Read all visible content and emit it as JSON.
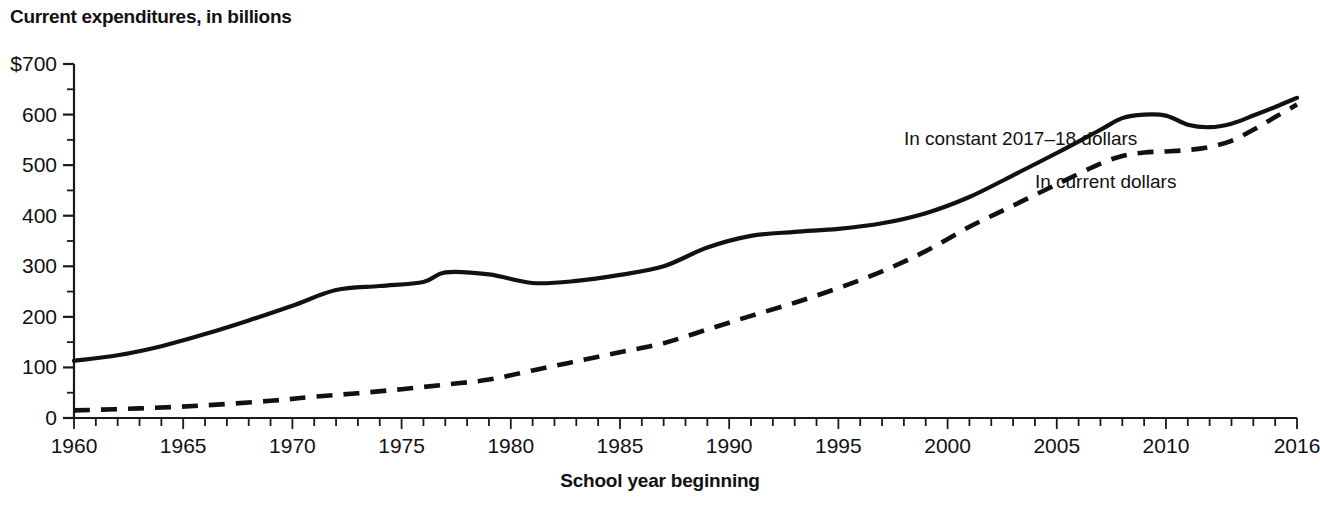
{
  "chart_data": {
    "type": "line",
    "title": "Current expenditures, in billions",
    "ylabel": "Current expenditures, in billions",
    "xlabel": "School year beginning",
    "xlim": [
      1960,
      2016
    ],
    "ylim": [
      0,
      700
    ],
    "grid": false,
    "legend_position": "inline-annotation",
    "y_ticks_major": [
      "$700",
      "600",
      "500",
      "400",
      "300",
      "200",
      "100",
      "0"
    ],
    "y_tick_values": [
      700,
      600,
      500,
      400,
      300,
      200,
      100,
      0
    ],
    "y_minor_tick_values": [
      650,
      550,
      450,
      350,
      250,
      150,
      50
    ],
    "x_ticks_labeled": [
      "1960",
      "1965",
      "1970",
      "1975",
      "1980",
      "1985",
      "1990",
      "1995",
      "2000",
      "2005",
      "2010",
      "2016"
    ],
    "x_tick_label_values": [
      1960,
      1965,
      1970,
      1975,
      1980,
      1985,
      1990,
      1995,
      2000,
      2005,
      2010,
      2016
    ],
    "x_tick_step": 1,
    "x": [
      1960,
      1961,
      1962,
      1963,
      1964,
      1965,
      1966,
      1967,
      1968,
      1969,
      1970,
      1971,
      1972,
      1973,
      1974,
      1975,
      1976,
      1977,
      1978,
      1979,
      1980,
      1981,
      1982,
      1983,
      1984,
      1985,
      1986,
      1987,
      1988,
      1989,
      1990,
      1991,
      1992,
      1993,
      1994,
      1995,
      1996,
      1997,
      1998,
      1999,
      2000,
      2001,
      2002,
      2003,
      2004,
      2005,
      2006,
      2007,
      2008,
      2009,
      2010,
      2011,
      2012,
      2013,
      2014,
      2015,
      2016
    ],
    "series": [
      {
        "name": "In constant 2017–18 dollars",
        "style": "solid",
        "label_x": 1998,
        "label_y": 540,
        "values": [
          113,
          119,
          125,
          133,
          143,
          155,
          167,
          180,
          194,
          208,
          222,
          237,
          250,
          258,
          262,
          265,
          269,
          275,
          282,
          288,
          285,
          278,
          270,
          267,
          269,
          275,
          283,
          294,
          307,
          322,
          337,
          350,
          360,
          366,
          369,
          371,
          372,
          374,
          377,
          381,
          386,
          393,
          402,
          409,
          413,
          417,
          424,
          436,
          452,
          470,
          489,
          505,
          518,
          530,
          543,
          556,
          566
        ]
      },
      {
        "name": "In current dollars",
        "style": "dashed",
        "label_x": 2004,
        "label_y": 455,
        "values": [
          15,
          16,
          17,
          18,
          20,
          22,
          24,
          27,
          30,
          34,
          38,
          42,
          46,
          49,
          52,
          55,
          59,
          63,
          68,
          73,
          80,
          88,
          95,
          103,
          110,
          117,
          126,
          136,
          147,
          159,
          172,
          185,
          197,
          206,
          215,
          226,
          238,
          252,
          267,
          284,
          304,
          327,
          348,
          368,
          385,
          402,
          425,
          449,
          476,
          494,
          508,
          519,
          524,
          527,
          532,
          540,
          548
        ]
      }
    ],
    "curves": {
      "solid_points": [
        [
          1960,
          113
        ],
        [
          1962,
          124
        ],
        [
          1964,
          142
        ],
        [
          1966,
          166
        ],
        [
          1968,
          193
        ],
        [
          1970,
          222
        ],
        [
          1972,
          253
        ],
        [
          1974,
          261
        ],
        [
          1976,
          269
        ],
        [
          1977,
          288
        ],
        [
          1979,
          284
        ],
        [
          1981,
          267
        ],
        [
          1983,
          271
        ],
        [
          1985,
          283
        ],
        [
          1987,
          300
        ],
        [
          1989,
          337
        ],
        [
          1991,
          360
        ],
        [
          1993,
          368
        ],
        [
          1995,
          374
        ],
        [
          1997,
          385
        ],
        [
          1999,
          405
        ],
        [
          2001,
          437
        ],
        [
          2003,
          480
        ],
        [
          2005,
          524
        ],
        [
          2007,
          570
        ],
        [
          2008,
          593
        ],
        [
          2009,
          600
        ],
        [
          2010,
          598
        ],
        [
          2011,
          580
        ],
        [
          2012,
          575
        ],
        [
          2013,
          582
        ],
        [
          2014,
          598
        ],
        [
          2015,
          615
        ],
        [
          2016,
          633
        ]
      ],
      "dashed_points": [
        [
          1960,
          15
        ],
        [
          1963,
          19
        ],
        [
          1966,
          25
        ],
        [
          1969,
          34
        ],
        [
          1971,
          42
        ],
        [
          1973,
          49
        ],
        [
          1975,
          57
        ],
        [
          1977,
          66
        ],
        [
          1979,
          76
        ],
        [
          1981,
          94
        ],
        [
          1983,
          112
        ],
        [
          1985,
          130
        ],
        [
          1987,
          148
        ],
        [
          1989,
          175
        ],
        [
          1991,
          202
        ],
        [
          1993,
          228
        ],
        [
          1995,
          257
        ],
        [
          1997,
          290
        ],
        [
          1999,
          330
        ],
        [
          2001,
          378
        ],
        [
          2003,
          420
        ],
        [
          2005,
          462
        ],
        [
          2007,
          503
        ],
        [
          2008,
          518
        ],
        [
          2009,
          525
        ],
        [
          2010,
          527
        ],
        [
          2011,
          530
        ],
        [
          2012,
          536
        ],
        [
          2013,
          548
        ],
        [
          2014,
          570
        ],
        [
          2015,
          595
        ],
        [
          2016,
          620
        ]
      ]
    },
    "colors": {
      "line": "#111111",
      "axis": "#1a1a1a",
      "text": "#111111",
      "background": "#ffffff"
    }
  }
}
